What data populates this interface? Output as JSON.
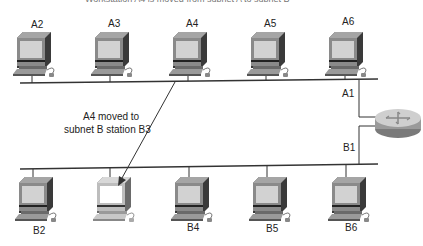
{
  "header": {
    "title_cutoff": "Workstation A4 is moved from subnet A to subnet B"
  },
  "subnet_a": {
    "stations": [
      {
        "label": "A2",
        "x": 33
      },
      {
        "label": "A3",
        "x": 112
      },
      {
        "label": "A4",
        "x": 190
      },
      {
        "label": "A5",
        "x": 268
      },
      {
        "label": "A6",
        "x": 346
      }
    ],
    "router_port": "A1"
  },
  "subnet_b": {
    "stations": [
      {
        "label": "B2",
        "x": 33
      },
      {
        "label": "",
        "x": 112,
        "moved": true
      },
      {
        "label": "B4",
        "x": 190
      },
      {
        "label": "B5",
        "x": 268
      },
      {
        "label": "B6",
        "x": 346
      }
    ],
    "router_port": "B1"
  },
  "annotation": {
    "line1": "A4 moved to",
    "line2": "subnet B station B3"
  },
  "colors": {
    "line": "#333333",
    "monitor": "#8a8a8a",
    "monitor_dark": "#3a3a3a",
    "screen": "#d2d2d2",
    "moved_monitor": "#bdbdbd",
    "moved_screen": "#ffffff"
  }
}
